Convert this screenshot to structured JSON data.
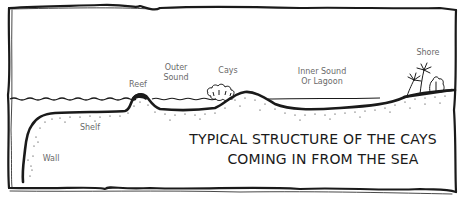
{
  "diagram": {
    "title_lines": [
      "TYPICAL STRUCTURE OF THE CAYS",
      "COMING IN FROM THE SEA"
    ],
    "labels": {
      "reef": "Reef",
      "outer_sound_line1": "Outer",
      "outer_sound_line2": "Sound",
      "cays": "Cays",
      "inner_sound_line1": "Inner Sound",
      "inner_sound_line2": "Or Lagoon",
      "shore": "Shore",
      "shelf": "Shelf",
      "wall": "Wall"
    },
    "colors": {
      "ink": "#1a1a1a",
      "label": "#6a6a6a",
      "background": "#ffffff"
    }
  }
}
